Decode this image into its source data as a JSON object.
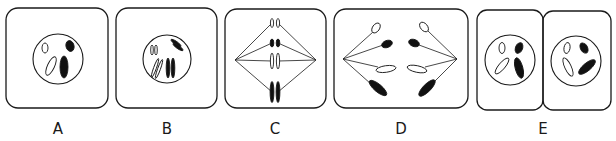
{
  "figure": {
    "stroke_color": "#1a1a1a",
    "fill_dark": "#111111",
    "fill_light": "#ffffff",
    "panels": [
      {
        "id": "A",
        "label": "A",
        "label_x": 58,
        "cells": [
          {
            "x": 6,
            "y": 8,
            "w": 102,
            "h": 100,
            "r": 12
          }
        ],
        "nuclei": [
          {
            "cx": 58,
            "cy": 59,
            "r": 25
          }
        ],
        "spindles": [],
        "chromosomes": [
          {
            "cx": 45,
            "cy": 48,
            "rx": 3,
            "ry": 5,
            "rot": 0,
            "fill": "light"
          },
          {
            "cx": 51,
            "cy": 66,
            "rx": 3.5,
            "ry": 10,
            "rot": 25,
            "fill": "light"
          },
          {
            "cx": 70,
            "cy": 46,
            "rx": 4,
            "ry": 5.5,
            "rot": -15,
            "fill": "dark"
          },
          {
            "cx": 64,
            "cy": 67,
            "rx": 4,
            "ry": 11,
            "rot": 0,
            "fill": "dark"
          }
        ]
      },
      {
        "id": "B",
        "label": "B",
        "label_x": 167,
        "cells": [
          {
            "x": 116,
            "y": 8,
            "w": 101,
            "h": 100,
            "r": 12
          }
        ],
        "nuclei": [
          {
            "cx": 167,
            "cy": 59,
            "r": 24
          }
        ],
        "spindles": [],
        "chromosomes": [
          {
            "cx": 152,
            "cy": 50,
            "rx": 1.3,
            "ry": 5,
            "rot": 0,
            "fill": "light"
          },
          {
            "cx": 156,
            "cy": 50,
            "rx": 1.3,
            "ry": 5,
            "rot": 0,
            "fill": "light"
          },
          {
            "cx": 155,
            "cy": 68,
            "rx": 1.4,
            "ry": 10,
            "rot": 20,
            "fill": "light"
          },
          {
            "cx": 159,
            "cy": 69,
            "rx": 1.4,
            "ry": 10,
            "rot": 20,
            "fill": "light"
          },
          {
            "cx": 176,
            "cy": 43,
            "rx": 1.6,
            "ry": 6,
            "rot": -55,
            "fill": "dark"
          },
          {
            "cx": 178,
            "cy": 47,
            "rx": 1.6,
            "ry": 6,
            "rot": -55,
            "fill": "dark"
          },
          {
            "cx": 168,
            "cy": 68,
            "rx": 1.8,
            "ry": 10,
            "rot": 0,
            "fill": "dark"
          },
          {
            "cx": 173,
            "cy": 68,
            "rx": 1.8,
            "ry": 10,
            "rot": 0,
            "fill": "dark"
          }
        ]
      },
      {
        "id": "C",
        "label": "C",
        "label_x": 275,
        "cells": [
          {
            "x": 225,
            "y": 9,
            "w": 101,
            "h": 99,
            "r": 12
          }
        ],
        "nuclei": [],
        "spindles": [
          {
            "pole": [
              235,
              60
            ],
            "targets": [
              [
                272,
                23
              ],
              [
                272,
                43
              ],
              [
                272,
                61
              ],
              [
                272,
                92
              ]
            ]
          },
          {
            "pole": [
              316,
              60
            ],
            "targets": [
              [
                278,
                23
              ],
              [
                278,
                43
              ],
              [
                278,
                61
              ],
              [
                278,
                92
              ]
            ]
          }
        ],
        "chromosomes": [
          {
            "cx": 272,
            "cy": 23,
            "rx": 1.6,
            "ry": 4.5,
            "rot": 0,
            "fill": "light"
          },
          {
            "cx": 278,
            "cy": 23,
            "rx": 1.6,
            "ry": 4.5,
            "rot": 0,
            "fill": "light"
          },
          {
            "cx": 272,
            "cy": 43,
            "rx": 1.8,
            "ry": 4,
            "rot": 0,
            "fill": "dark"
          },
          {
            "cx": 278,
            "cy": 43,
            "rx": 1.8,
            "ry": 4,
            "rot": 0,
            "fill": "dark"
          },
          {
            "cx": 272,
            "cy": 61,
            "rx": 1.6,
            "ry": 8,
            "rot": 0,
            "fill": "light"
          },
          {
            "cx": 278,
            "cy": 61,
            "rx": 1.6,
            "ry": 8,
            "rot": 0,
            "fill": "light"
          },
          {
            "cx": 272,
            "cy": 92,
            "rx": 1.9,
            "ry": 10.5,
            "rot": 0,
            "fill": "dark"
          },
          {
            "cx": 278,
            "cy": 92,
            "rx": 1.9,
            "ry": 10.5,
            "rot": 0,
            "fill": "dark"
          }
        ]
      },
      {
        "id": "D",
        "label": "D",
        "label_x": 401,
        "cells": [
          {
            "x": 334,
            "y": 9,
            "w": 134,
            "h": 99,
            "r": 12
          }
        ],
        "nuclei": [],
        "spindles": [
          {
            "pole": [
              343,
              59
            ],
            "targets": [
              [
                373,
                32
              ],
              [
                383,
                45
              ],
              [
                378,
                67
              ],
              [
                371,
                84
              ]
            ]
          },
          {
            "pole": [
              457,
              59
            ],
            "targets": [
              [
                428,
                31
              ],
              [
                419,
                45
              ],
              [
                425,
                67
              ],
              [
                432,
                84
              ]
            ]
          }
        ],
        "chromosomes": [
          {
            "cx": 376,
            "cy": 28,
            "rx": 3.5,
            "ry": 5.5,
            "rot": 35,
            "fill": "light"
          },
          {
            "cx": 387,
            "cy": 44,
            "rx": 3.5,
            "ry": 5.5,
            "rot": 70,
            "fill": "dark"
          },
          {
            "cx": 386,
            "cy": 69,
            "rx": 3.3,
            "ry": 10,
            "rot": 82,
            "fill": "light"
          },
          {
            "cx": 378,
            "cy": 88,
            "rx": 3.8,
            "ry": 11,
            "rot": -50,
            "fill": "dark"
          },
          {
            "cx": 424,
            "cy": 27,
            "rx": 3.5,
            "ry": 5.5,
            "rot": -40,
            "fill": "light"
          },
          {
            "cx": 414,
            "cy": 43,
            "rx": 3.5,
            "ry": 5.5,
            "rot": -70,
            "fill": "dark"
          },
          {
            "cx": 417,
            "cy": 69,
            "rx": 3.3,
            "ry": 10,
            "rot": -78,
            "fill": "light"
          },
          {
            "cx": 427,
            "cy": 88,
            "rx": 3.8,
            "ry": 11,
            "rot": 45,
            "fill": "dark"
          }
        ]
      },
      {
        "id": "E",
        "label": "E",
        "label_x": 543,
        "cells": [
          {
            "x": 477,
            "y": 10,
            "w": 66,
            "h": 100,
            "r": 10
          },
          {
            "x": 543,
            "y": 11,
            "w": 68,
            "h": 99,
            "r": 10
          }
        ],
        "nuclei": [
          {
            "cx": 510,
            "cy": 60,
            "r": 25
          },
          {
            "cx": 576,
            "cy": 61,
            "r": 25
          }
        ],
        "spindles": [],
        "chromosomes": [
          {
            "cx": 502,
            "cy": 48,
            "rx": 3,
            "ry": 5.5,
            "rot": 0,
            "fill": "light"
          },
          {
            "cx": 502,
            "cy": 66,
            "rx": 3.2,
            "ry": 10,
            "rot": 40,
            "fill": "light"
          },
          {
            "cx": 519,
            "cy": 48,
            "rx": 3.5,
            "ry": 5.5,
            "rot": 25,
            "fill": "dark"
          },
          {
            "cx": 519,
            "cy": 68,
            "rx": 3.8,
            "ry": 10.5,
            "rot": -15,
            "fill": "dark"
          },
          {
            "cx": 567,
            "cy": 48,
            "rx": 3,
            "ry": 5.5,
            "rot": 10,
            "fill": "light"
          },
          {
            "cx": 568,
            "cy": 67,
            "rx": 3.2,
            "ry": 10,
            "rot": -25,
            "fill": "light"
          },
          {
            "cx": 584,
            "cy": 48,
            "rx": 3.5,
            "ry": 5.5,
            "rot": -30,
            "fill": "dark"
          },
          {
            "cx": 587,
            "cy": 67,
            "rx": 3.8,
            "ry": 10.5,
            "rot": 50,
            "fill": "dark"
          }
        ]
      }
    ]
  }
}
